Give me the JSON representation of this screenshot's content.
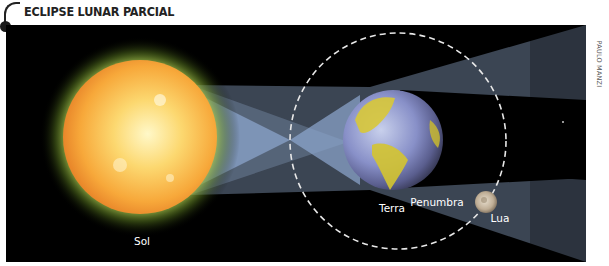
{
  "header": {
    "title": "ECLIPSE LUNAR PARCIAL"
  },
  "credit": "PAULO MANZI",
  "labels": {
    "sun": "Sol",
    "earth": "Terra",
    "penumbra": "Penumbra",
    "moon": "Lua"
  },
  "colors": {
    "background": "#000000",
    "sun_core": "#fff6c0",
    "sun_mid": "#f8b540",
    "sun_edge": "#e8862a",
    "sun_glow": "#c8e060",
    "light_cone": "#8fa8cc",
    "earth_ocean": "#8a92c8",
    "earth_land": "#d8c838",
    "moon": "#c8b8a0",
    "orbit": "#e0e0e0",
    "label": "#ffffff"
  }
}
